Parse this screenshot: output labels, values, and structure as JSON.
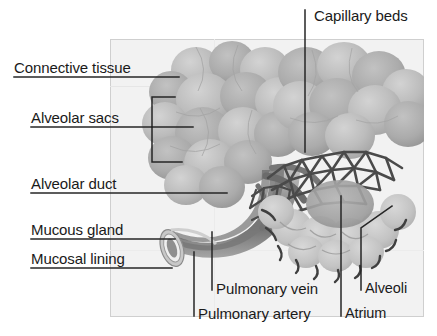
{
  "figure": {
    "type": "anatomical-diagram",
    "style": "grayscale halftone illustration with leader-line callouts",
    "frame": {
      "x": 110,
      "y": 39,
      "width": 314,
      "height": 278,
      "border_color": "#cfcfcf",
      "fill_color": "#f2f2f2"
    },
    "page_background": "#ffffff"
  },
  "palette": {
    "ink": "#1a1a1a",
    "leader_line": "#262626",
    "frame_border": "#cfcfcf",
    "frame_fill": "#f2f2f2",
    "sac_light": "#c9c9c9",
    "sac_mid": "#b0b0b0",
    "sac_dark": "#9a9a9a",
    "duct_light": "#bdbdbd",
    "duct_dark": "#6e6e6e",
    "capillary": "#4a4a4a",
    "alveoli_fill": "#bcbcbc",
    "atrium_fill": "#a2a2a2",
    "highlight": "#e4e4e4"
  },
  "labels": [
    {
      "id": "capillary-beds",
      "text": "Capillary beds",
      "x": 314,
      "y": 8,
      "align": "left"
    },
    {
      "id": "connective-tissue",
      "text": "Connective tissue",
      "x": 14,
      "y": 60,
      "align": "left"
    },
    {
      "id": "alveolar-sacs",
      "text": "Alveolar sacs",
      "x": 31,
      "y": 110,
      "align": "left"
    },
    {
      "id": "alveolar-duct",
      "text": "Alveolar duct",
      "x": 31,
      "y": 176,
      "align": "left"
    },
    {
      "id": "mucous-gland",
      "text": "Mucous gland",
      "x": 31,
      "y": 222,
      "align": "left"
    },
    {
      "id": "mucosal-lining",
      "text": "Mucosal lining",
      "x": 31,
      "y": 251,
      "align": "left"
    },
    {
      "id": "pulmonary-vein",
      "text": "Pulmonary vein",
      "x": 216,
      "y": 281,
      "align": "left"
    },
    {
      "id": "pulmonary-artery",
      "text": "Pulmonary artery",
      "x": 198,
      "y": 306,
      "align": "left"
    },
    {
      "id": "alveoli",
      "text": "Alveoli",
      "x": 365,
      "y": 281,
      "align": "left"
    },
    {
      "id": "atrium",
      "text": "Atrium",
      "x": 345,
      "y": 306,
      "align": "left"
    }
  ],
  "leader_lines": [
    {
      "id": "leader-capillary-beds",
      "kind": "vertical",
      "points": "305,10 305,152"
    },
    {
      "id": "leader-connective-tissue",
      "kind": "underline",
      "points": "14,77 179,77"
    },
    {
      "id": "leader-alveolar-sacs",
      "kind": "bracket",
      "points": "31,127 152,127 152,97 175,97"
    },
    {
      "id": "leader-alveolar-sacs-b",
      "kind": "bracket",
      "points": "152,127 193,127"
    },
    {
      "id": "leader-alveolar-sacs-c",
      "kind": "bracket",
      "points": "152,127 152,162 182,162"
    },
    {
      "id": "leader-alveolar-duct",
      "kind": "underline",
      "points": "31,193 227,193"
    },
    {
      "id": "leader-mucous-gland",
      "kind": "underline",
      "points": "31,239 175,239"
    },
    {
      "id": "leader-mucosal-lining",
      "kind": "underline",
      "points": "31,268 172,268"
    },
    {
      "id": "leader-pulmonary-vein",
      "kind": "vertical",
      "points": "212,232 212,290"
    },
    {
      "id": "leader-pulmonary-artery",
      "kind": "vertical",
      "points": "194,252 194,316"
    },
    {
      "id": "leader-atrium",
      "kind": "vertical",
      "points": "341,196 341,316"
    },
    {
      "id": "leader-alveoli",
      "kind": "diagonal",
      "points": "361,290 361,228 392,206"
    }
  ]
}
